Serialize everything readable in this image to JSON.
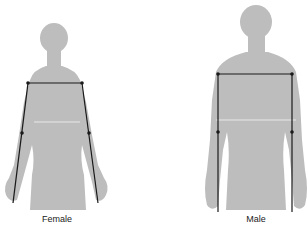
{
  "figures": [
    {
      "label": "Female",
      "silhouette_color": "#bdbdbd",
      "line_color": "#1a1a1a"
    },
    {
      "label": "Male",
      "silhouette_color": "#bdbdbd",
      "line_color": "#1a1a1a"
    }
  ],
  "measurements": [
    {
      "name": "shoulder-width"
    },
    {
      "name": "sleeve-length"
    }
  ]
}
